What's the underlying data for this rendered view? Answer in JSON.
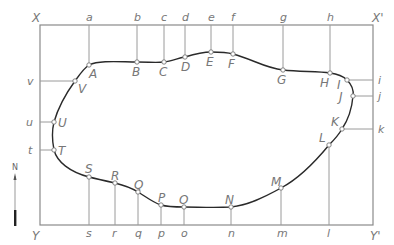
{
  "frame": {
    "corners": {
      "top_left": "X",
      "top_right": "X'",
      "bottom_left": "Y",
      "bottom_right": "Y'"
    },
    "box": {
      "left": 40,
      "top": 25,
      "right": 373,
      "bottom": 225
    }
  },
  "north_arrow": {
    "label": "N"
  },
  "curve_points": [
    {
      "label": "A",
      "x": 89,
      "y": 65,
      "ref": "a",
      "side": "top"
    },
    {
      "label": "B",
      "x": 137,
      "y": 62,
      "ref": "b",
      "side": "top"
    },
    {
      "label": "C",
      "x": 164,
      "y": 62,
      "ref": "c",
      "side": "top"
    },
    {
      "label": "D",
      "x": 185,
      "y": 57,
      "ref": "d",
      "side": "top"
    },
    {
      "label": "E",
      "x": 211,
      "y": 52,
      "ref": "e",
      "side": "top"
    },
    {
      "label": "F",
      "x": 233,
      "y": 54,
      "ref": "f",
      "side": "top"
    },
    {
      "label": "G",
      "x": 283,
      "y": 70,
      "ref": "g",
      "side": "top"
    },
    {
      "label": "H",
      "x": 330,
      "y": 73,
      "ref": "h",
      "side": "top"
    },
    {
      "label": "I",
      "x": 347,
      "y": 80,
      "ref": "i",
      "side": "right"
    },
    {
      "label": "J",
      "x": 353,
      "y": 96,
      "ref": "j",
      "side": "right"
    },
    {
      "label": "K",
      "x": 342,
      "y": 129,
      "ref": "k",
      "side": "right"
    },
    {
      "label": "L",
      "x": 329,
      "y": 145,
      "ref": "l",
      "side": "bottom"
    },
    {
      "label": "M",
      "x": 281,
      "y": 188,
      "ref": "m",
      "side": "bottom"
    },
    {
      "label": "N",
      "x": 231,
      "y": 207,
      "ref": "n",
      "side": "bottom"
    },
    {
      "label": "O",
      "x": 184,
      "y": 207,
      "ref": "o",
      "side": "bottom"
    },
    {
      "label": "P",
      "x": 161,
      "y": 205,
      "ref": "p",
      "side": "bottom"
    },
    {
      "label": "Q",
      "x": 138,
      "y": 192,
      "ref": "q",
      "side": "bottom"
    },
    {
      "label": "R",
      "x": 115,
      "y": 183,
      "ref": "r",
      "side": "bottom"
    },
    {
      "label": "S",
      "x": 89,
      "y": 177,
      "ref": "s",
      "side": "bottom"
    },
    {
      "label": "T",
      "x": 54,
      "y": 150,
      "ref": "t",
      "side": "left"
    },
    {
      "label": "U",
      "x": 54,
      "y": 122,
      "ref": "u",
      "side": "left"
    },
    {
      "label": "V",
      "x": 75,
      "y": 81,
      "ref": "v",
      "side": "left"
    }
  ],
  "labels": {
    "X": "X",
    "Xp": "X'",
    "Y": "Y",
    "Yp": "Y'",
    "N": "N",
    "a": "a",
    "b": "b",
    "c": "c",
    "d": "d",
    "e": "e",
    "f": "f",
    "g": "g",
    "h": "h",
    "i": "i",
    "j": "j",
    "k": "k",
    "l": "l",
    "m": "m",
    "n": "n",
    "o": "o",
    "p": "p",
    "q": "q",
    "r": "r",
    "s": "s",
    "t": "t",
    "u": "u",
    "v": "v",
    "A": "A",
    "B": "B",
    "C": "C",
    "D": "D",
    "E": "E",
    "F": "F",
    "G": "G",
    "H": "H",
    "I": "I",
    "J": "J",
    "K": "K",
    "L": "L",
    "M": "M",
    "Np": "N",
    "O": "O",
    "P": "P",
    "Q": "Q",
    "R": "R",
    "S": "S",
    "T": "T",
    "U": "U",
    "V": "V"
  }
}
